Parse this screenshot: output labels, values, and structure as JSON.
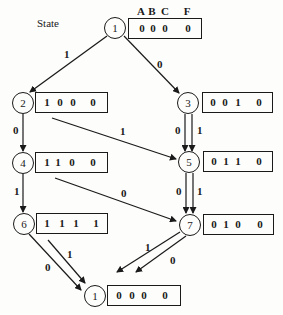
{
  "diagram": {
    "state_label": "State",
    "columns": [
      "A",
      "B",
      "C",
      "F"
    ],
    "line_color": "#1a1a1a",
    "nodes": [
      {
        "id": "top1",
        "label": "1",
        "bits": [
          "0",
          "0",
          "0",
          "0"
        ]
      },
      {
        "id": "n2",
        "label": "2",
        "bits": [
          "1",
          "0",
          "0",
          "0"
        ]
      },
      {
        "id": "n3",
        "label": "3",
        "bits": [
          "0",
          "0",
          "1",
          "0"
        ]
      },
      {
        "id": "n4",
        "label": "4",
        "bits": [
          "1",
          "1",
          "0",
          "0"
        ]
      },
      {
        "id": "n5",
        "label": "5",
        "bits": [
          "0",
          "1",
          "1",
          "0"
        ]
      },
      {
        "id": "n6",
        "label": "6",
        "bits": [
          "1",
          "1",
          "1",
          "1"
        ]
      },
      {
        "id": "n7",
        "label": "7",
        "bits": [
          "0",
          "1",
          "0",
          "0"
        ]
      },
      {
        "id": "bot1",
        "label": "1",
        "bits": [
          "0",
          "0",
          "0",
          "0"
        ]
      }
    ],
    "edges": [
      {
        "from": "1",
        "to": "2",
        "input": "1"
      },
      {
        "from": "1",
        "to": "3",
        "input": "0"
      },
      {
        "from": "2",
        "to": "4",
        "input": "0"
      },
      {
        "from": "2",
        "to": "5",
        "input": "1"
      },
      {
        "from": "3",
        "to": "5",
        "input_left": "0",
        "input_right": "1"
      },
      {
        "from": "4",
        "to": "6",
        "input": "1"
      },
      {
        "from": "4",
        "to": "7",
        "input": "0"
      },
      {
        "from": "5",
        "to": "7",
        "input_left": "0",
        "input_right": "1"
      },
      {
        "from": "6",
        "to": "1",
        "input_a": "0",
        "input_b": "1"
      },
      {
        "from": "7",
        "to": "1",
        "input_a": "1",
        "input_b": "0"
      }
    ]
  }
}
